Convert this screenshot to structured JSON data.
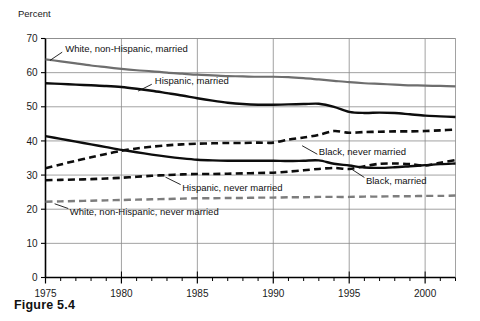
{
  "figure": {
    "caption": "Figure 5.4",
    "y_axis_title": "Percent"
  },
  "chart_data": {
    "type": "line",
    "title": "",
    "subtitle": "",
    "xlabel": "",
    "ylabel": "Percent",
    "xlim": [
      1975,
      2002
    ],
    "ylim": [
      0,
      70
    ],
    "grid": true,
    "legend_position": "inline-annotations",
    "x_ticks": [
      1975,
      1980,
      1985,
      1990,
      1995,
      2000
    ],
    "x_tick_labels": [
      "1975",
      "1980",
      "1985",
      "1990",
      "1995",
      "2000"
    ],
    "x_minor_tick_interval": 1,
    "y_ticks": [
      0,
      10,
      20,
      30,
      40,
      50,
      60,
      70
    ],
    "y_tick_labels": [
      "0",
      "10",
      "20",
      "30",
      "40",
      "50",
      "60",
      "70"
    ],
    "x": [
      1975,
      1976,
      1977,
      1978,
      1979,
      1980,
      1981,
      1982,
      1983,
      1984,
      1985,
      1986,
      1987,
      1988,
      1989,
      1990,
      1991,
      1992,
      1993,
      1994,
      1995,
      1996,
      1997,
      1998,
      1999,
      2000,
      2001,
      2002
    ],
    "series": [
      {
        "name": "White, non-Hispanic, married",
        "style": "solid",
        "color": "#6e6e6e",
        "width": 2.2,
        "values": [
          63.9,
          63.3,
          62.7,
          62.1,
          61.6,
          61.1,
          60.7,
          60.4,
          60.0,
          59.7,
          59.4,
          59.2,
          59.0,
          58.9,
          58.8,
          58.8,
          58.7,
          58.4,
          58.0,
          57.6,
          57.2,
          56.9,
          56.7,
          56.5,
          56.3,
          56.2,
          56.1,
          56.0
        ],
        "label_text": "White, non-Hispanic, married",
        "label_x": 1976.3,
        "label_y": 67.0
      },
      {
        "name": "Hispanic, married",
        "style": "solid",
        "color": "#0d0d0d",
        "width": 2.4,
        "values": [
          56.9,
          56.7,
          56.5,
          56.3,
          56.1,
          55.8,
          55.3,
          54.7,
          54.0,
          53.3,
          52.5,
          51.8,
          51.2,
          50.8,
          50.6,
          50.6,
          50.7,
          50.8,
          50.9,
          50.0,
          48.5,
          48.2,
          48.3,
          48.2,
          47.8,
          47.4,
          47.2,
          47.0
        ],
        "label_text": "Hispanic, married",
        "label_x": 1982.2,
        "label_y": 57.6
      },
      {
        "name": "Black, married",
        "style": "solid",
        "color": "#0d0d0d",
        "width": 2.4,
        "values": [
          41.4,
          40.6,
          39.8,
          39.0,
          38.2,
          37.4,
          36.7,
          36.0,
          35.4,
          34.9,
          34.5,
          34.3,
          34.2,
          34.2,
          34.2,
          34.2,
          34.1,
          34.2,
          34.3,
          33.3,
          32.8,
          32.2,
          32.1,
          32.3,
          32.6,
          32.9,
          33.2,
          33.4
        ],
        "label_text": "Black, married",
        "label_x": 1996.1,
        "label_y": 28.4
      },
      {
        "name": "Black, never married",
        "style": "dashed",
        "color": "#0d0d0d",
        "width": 2.6,
        "values": [
          32.0,
          33.1,
          34.2,
          35.2,
          36.2,
          37.1,
          37.8,
          38.3,
          38.7,
          39.0,
          39.2,
          39.3,
          39.4,
          39.4,
          39.5,
          39.5,
          40.4,
          41.0,
          41.8,
          42.9,
          42.4,
          42.6,
          42.7,
          42.8,
          42.8,
          42.9,
          43.1,
          43.3
        ],
        "label_text": "Black, never married",
        "label_x": 1993.0,
        "label_y": 37.0
      },
      {
        "name": "Hispanic, never married",
        "style": "dashed",
        "color": "#0d0d0d",
        "width": 2.6,
        "values": [
          28.5,
          28.6,
          28.7,
          28.8,
          29.0,
          29.2,
          29.5,
          29.8,
          30.0,
          30.2,
          30.3,
          30.3,
          30.4,
          30.5,
          30.6,
          30.7,
          31.0,
          31.4,
          31.8,
          32.1,
          31.8,
          32.6,
          33.3,
          33.4,
          33.2,
          32.8,
          33.6,
          34.4
        ],
        "label_text": "Hispanic, never married",
        "label_x": 1984.0,
        "label_y": 26.4
      },
      {
        "name": "White, non-Hispanic, never married",
        "style": "dashed",
        "color": "#7d7d7d",
        "width": 2.4,
        "values": [
          22.2,
          22.3,
          22.4,
          22.5,
          22.6,
          22.7,
          22.8,
          22.9,
          23.0,
          23.1,
          23.2,
          23.2,
          23.3,
          23.3,
          23.4,
          23.4,
          23.5,
          23.5,
          23.6,
          23.6,
          23.6,
          23.7,
          23.7,
          23.8,
          23.8,
          23.9,
          23.9,
          24.0
        ],
        "label_text": "White, non-Hispanic, never married",
        "label_x": 1976.6,
        "label_y": 19.3
      }
    ]
  },
  "colors": {
    "gray_series": "#6e6e6e",
    "black_series": "#0d0d0d",
    "gridline": "#8a8a8a",
    "axis": "#000000",
    "background": "#ffffff"
  }
}
